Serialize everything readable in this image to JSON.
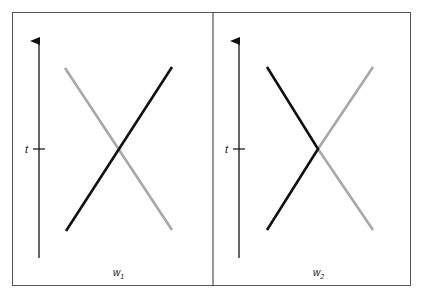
{
  "figure": {
    "frame_color": "#555555",
    "black_line_color": "#111111",
    "gray_line_color": "#a8a8a8",
    "panels": [
      {
        "id": "left",
        "axis_label": "t",
        "x_label_base": "w",
        "x_label_sub": "1",
        "description": "Two straight worldlines cross at time t (X shape): black rises left-to-right, gray falls left-to-right."
      },
      {
        "id": "right",
        "axis_label": "t",
        "x_label_base": "w",
        "x_label_sub": "2",
        "description": "Worldlines meet at time t and bounce: black forms a '<' shape, gray forms a '>' shape."
      }
    ]
  }
}
